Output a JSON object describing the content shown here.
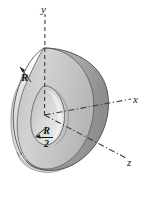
{
  "figure": {
    "kind": "3d-engineering-diagram",
    "background_color": "#ffffff"
  },
  "axes": {
    "y": {
      "label": "y",
      "line_style": "dashed",
      "direction": "up",
      "from": [
        44,
        115
      ],
      "to": [
        45,
        14
      ]
    },
    "x": {
      "label": "x",
      "line_style": "dash-dot",
      "direction": "right-up",
      "from": [
        44,
        115
      ],
      "to": [
        130,
        99
      ]
    },
    "z": {
      "label": "z",
      "line_style": "dash-dot",
      "direction": "right-down",
      "from": [
        44,
        115
      ],
      "to": [
        125,
        158
      ]
    }
  },
  "dimensions": [
    {
      "name": "outer-radius",
      "label": "R",
      "kind": "plain",
      "leader_from": [
        32,
        82
      ],
      "leader_to": [
        20,
        68
      ]
    },
    {
      "name": "inner-radius",
      "label_numerator": "R",
      "label_denominator": "2",
      "kind": "fraction",
      "leader_from": [
        46,
        126
      ],
      "leader_to": [
        35,
        137
      ]
    }
  ],
  "geometry": {
    "outer_radius_label": "R",
    "inner_radius_label": "R/2",
    "inner_over_outer_ratio": 0.5
  },
  "colors": {
    "front_face": "#c9c9c9",
    "front_face_light": "#e4e4e4",
    "outer_rim": "#a8a8a8",
    "outer_rim_dark": "#8d8d8d",
    "inner_bore": "#d9d9d9",
    "inner_bore_light": "#f0f0f0",
    "outline": "#4a4a4a",
    "axis_line": "#3d3d3d",
    "label_text": "#111111"
  }
}
